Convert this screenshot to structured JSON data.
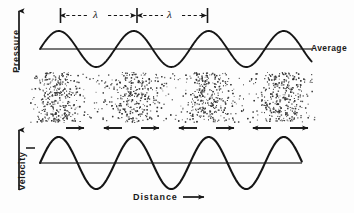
{
  "diagram": {
    "background_color": "#fdfdfd",
    "ink_color": "#161616",
    "baseline_color": "#4a4a4a"
  },
  "labels": {
    "pressure": "Pressure",
    "velocity": "Velocity",
    "distance": "Distance",
    "average": "Average",
    "lambda_1": "λ",
    "lambda_2": "λ",
    "distance_arrow": "arrow-right-icon",
    "pressure_arrow": "arrow-up-icon",
    "velocity_arrow": "arrow-up-icon"
  },
  "chart_data": {
    "type": "line",
    "xlabel": "Distance",
    "grid": false,
    "legend": "none",
    "panels": [
      {
        "name": "pressure-wave",
        "ylabel": "Pressure",
        "baseline_label": "Average",
        "waveform": "sine",
        "cycles": 3.6,
        "phase_deg": 0,
        "amplitude": 1.0,
        "baseline_value": 0,
        "x_start_px": 40,
        "x_end_px": 312,
        "baseline_y_px": 49,
        "amplitude_px": 18,
        "wavelength_px": 75,
        "peak_x_px": [
          58,
          133,
          208,
          283
        ],
        "trough_x_px": [
          96,
          171,
          246
        ]
      },
      {
        "name": "particle-density-band",
        "description": "dot field showing alternating compressions and rarefactions",
        "x_start_px": 30,
        "x_end_px": 316,
        "y_top_px": 72,
        "y_bottom_px": 122,
        "compression_centers_px": [
          58,
          133,
          208,
          283
        ],
        "rarefaction_centers_px": [
          96,
          171,
          246
        ],
        "dot_count": 2300,
        "dot_color": "#333333"
      },
      {
        "name": "particle-velocity-arrows",
        "description": "alternating direction arrows showing particle motion",
        "y_px": 128,
        "arrows": [
          {
            "x_px": 75,
            "direction": "right"
          },
          {
            "x_px": 113,
            "direction": "left"
          },
          {
            "x_px": 150,
            "direction": "right"
          },
          {
            "x_px": 188,
            "direction": "left"
          },
          {
            "x_px": 225,
            "direction": "right"
          },
          {
            "x_px": 262,
            "direction": "left"
          },
          {
            "x_px": 299,
            "direction": "right"
          }
        ]
      },
      {
        "name": "velocity-wave",
        "ylabel": "Velocity",
        "waveform": "sine",
        "cycles": 3.5,
        "phase_deg": 0,
        "amplitude": 1.0,
        "baseline_value": 0,
        "x_start_px": 40,
        "x_end_px": 302,
        "baseline_y_px": 163,
        "amplitude_px": 26,
        "wavelength_px": 75,
        "peak_x_px": [
          58,
          133,
          208,
          283
        ],
        "trough_x_px": [
          96,
          171,
          246
        ]
      }
    ],
    "wavelength_markers": [
      {
        "label": "λ",
        "x_start_px": 60,
        "x_end_px": 137,
        "y_px": 15
      },
      {
        "label": "λ",
        "x_start_px": 137,
        "x_end_px": 208,
        "y_px": 15
      }
    ]
  }
}
